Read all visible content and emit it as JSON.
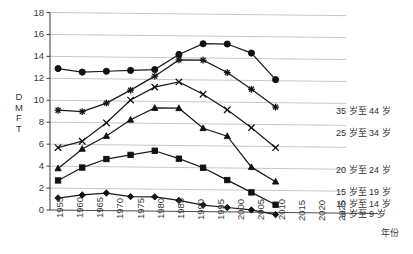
{
  "chart_data": {
    "type": "line",
    "title": "",
    "xlabel": "年份",
    "ylabel": "DMFT",
    "xlim": [
      1955,
      2025
    ],
    "ylim": [
      0,
      18
    ],
    "grid": true,
    "legend_position": "inline-right",
    "x": [
      1957,
      1963,
      1969,
      1975,
      1981,
      1987,
      1993,
      1999,
      2005,
      2011
    ],
    "xticks": [
      "1955",
      "1960",
      "1965",
      "1970",
      "1975",
      "1980",
      "1985",
      "1990",
      "1995",
      "2000",
      "2005",
      "2010",
      "2015",
      "2020",
      "2025"
    ],
    "yticks": [
      "0",
      "2",
      "4",
      "6",
      "8",
      "10",
      "12",
      "14",
      "16",
      "18"
    ],
    "series": [
      {
        "name": "35 岁至 44 岁",
        "marker": "circle",
        "values": [
          12.9,
          12.6,
          12.7,
          12.8,
          12.9,
          14.3,
          15.3,
          15.3,
          14.5,
          12.1
        ]
      },
      {
        "name": "25 岁至 34 岁",
        "marker": "star",
        "values": [
          9.1,
          9.0,
          9.8,
          11.0,
          12.3,
          13.8,
          13.8,
          12.7,
          11.2,
          9.6
        ]
      },
      {
        "name": "20 岁至 24 岁",
        "marker": "x",
        "values": [
          5.7,
          6.3,
          8.0,
          10.1,
          11.3,
          11.8,
          10.7,
          9.3,
          7.7,
          5.9
        ]
      },
      {
        "name": "15 岁至 19 岁",
        "marker": "triangle",
        "values": [
          3.8,
          5.6,
          6.8,
          8.3,
          9.4,
          9.4,
          7.6,
          6.9,
          4.1,
          2.8
        ]
      },
      {
        "name": "10 岁至 14 岁",
        "marker": "square",
        "values": [
          2.7,
          3.9,
          4.7,
          5.1,
          5.5,
          4.8,
          4.0,
          2.9,
          1.8,
          0.7
        ]
      },
      {
        "name": "5 岁至 9 岁",
        "marker": "diamond",
        "values": [
          1.1,
          1.4,
          1.6,
          1.3,
          1.3,
          1.0,
          0.6,
          0.4,
          0.2,
          -0.2
        ]
      }
    ]
  },
  "axes": {
    "y_title_chars": [
      "D",
      "M",
      "F",
      "T"
    ],
    "x_title": "年份"
  },
  "series_labels": [
    {
      "text": "35 岁至 44 岁"
    },
    {
      "text": "25 岁至 34 岁"
    },
    {
      "text": "20 岁至 24 岁"
    },
    {
      "text": "15 岁至 19 岁"
    },
    {
      "text": "10 岁至 14 岁"
    },
    {
      "text": "5 岁至 9 岁"
    }
  ]
}
